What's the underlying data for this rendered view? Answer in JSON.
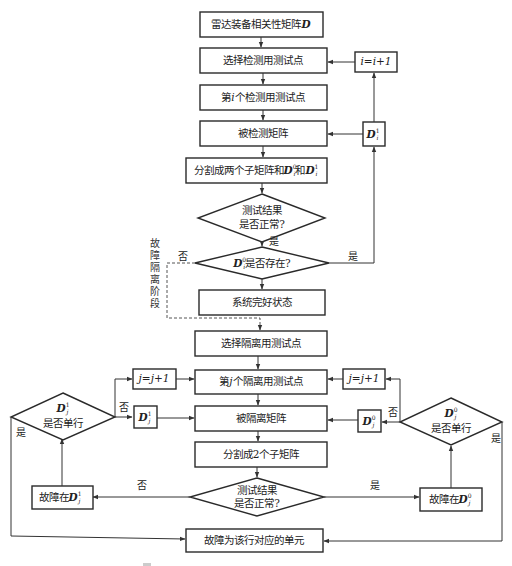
{
  "diagram": {
    "type": "flowchart",
    "title_top": "雷达装备相关性矩阵D",
    "detection_phase": {
      "start": {
        "text": "雷达装备相关性矩阵",
        "symbol": "D"
      },
      "select": "选择检测用测试点",
      "ith_point": {
        "pre": "第",
        "var": "i",
        "post": "个检测用测试点"
      },
      "tested_matrix": "被检测矩阵",
      "split": {
        "text": "分割成两个子矩阵和",
        "m0": "D",
        "m0_sup": "0",
        "m0_sub": "i",
        "and": "和",
        "m1": "D",
        "m1_sup": "1",
        "m1_sub": "i"
      },
      "decision1": {
        "line1": "测试结果",
        "line2": "是否正常?"
      },
      "decision2": {
        "sym": "D",
        "sup": "0",
        "sub": "i",
        "text": "是否存在?"
      },
      "increment": {
        "text": "i=i+1"
      },
      "side_matrix": {
        "sym": "D",
        "sup": "1",
        "sub": "i"
      },
      "good_state": "系统完好状态"
    },
    "isolation_label": [
      "故",
      "障",
      "隔",
      "离",
      "阶",
      "段"
    ],
    "isolation_phase": {
      "select": "选择隔离用测试点",
      "jth_point": {
        "pre": "第",
        "var": "j",
        "post": "个隔离用测试点"
      },
      "isolated_matrix": "被隔离矩阵",
      "split": "分割成2个子矩阵",
      "decision": {
        "line1": "测试结果",
        "line2": "是否正常?"
      },
      "left_increment": "j=j+1",
      "right_increment": "j=j+1",
      "left_matrix": {
        "sym": "D",
        "sup": "1",
        "sub": "j"
      },
      "right_matrix": {
        "sym": "D",
        "sup": "0",
        "sub": "j"
      },
      "left_decision": {
        "sym": "D",
        "sup": "1",
        "sub": "j",
        "text": "是否单行"
      },
      "right_decision": {
        "sym": "D",
        "sup": "0",
        "sub": "j",
        "text": "是否单行"
      },
      "left_fault": {
        "text": "故障在",
        "sym": "D",
        "sup": "1",
        "sub": "j"
      },
      "right_fault": {
        "text": "故障在",
        "sym": "D",
        "sup": "0",
        "sub": "j"
      },
      "final": "故障为该行对应的单元"
    },
    "edge_labels": {
      "yes": "是",
      "no": "否"
    }
  }
}
